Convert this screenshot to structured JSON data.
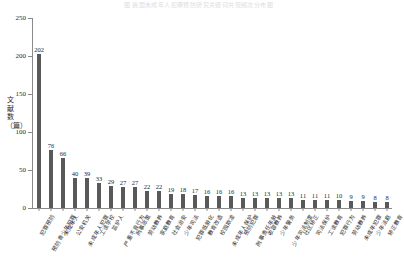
{
  "top_caption": "图 我国未成年人犯罪预防研究关键词共现频次分布图",
  "chart_data": {
    "type": "bar",
    "title": "",
    "subtitle": "",
    "xlabel": "",
    "ylabel": "文献数（篇）",
    "ylabel_chars": [
      "文",
      "献",
      "数",
      "（",
      "篇",
      "）"
    ],
    "ylim": [
      0,
      250
    ],
    "yticks": [
      0,
      50,
      100,
      150,
      200,
      250
    ],
    "ytick_labels": [
      "0",
      "50",
      "100",
      "150",
      "200",
      "250"
    ],
    "grid": false,
    "legend": null,
    "bar_color": "#595959",
    "axis_color": "#8a8a8a",
    "categories": [
      "犯罪预防",
      "预防青少年犯罪",
      "未成年人",
      "公安机关",
      "未成年人犯罪",
      "工读学校",
      "监护人",
      "严重不良行为",
      "刑事政策",
      "劳动教养",
      "家庭教育",
      "社会治安",
      "少年司法",
      "犯罪低龄化",
      "教育改造",
      "校园欺凌",
      "未成年人保护",
      "预防犯罪",
      "刑事责任年龄",
      "收容教养",
      "少年警务",
      "少年司法制度",
      "社区矫正",
      "司法保护",
      "工读教育",
      "犯罪行为",
      "劳动教养",
      "未成年犯罪",
      "少年法庭",
      "矫正教育"
    ],
    "values": [
      202,
      76,
      66,
      40,
      39,
      33,
      29,
      27,
      27,
      22,
      22,
      19,
      18,
      17,
      16,
      16,
      16,
      13,
      13,
      13,
      13,
      13,
      11,
      11,
      11,
      10,
      9,
      9,
      8,
      8
    ],
    "value_labels": [
      "202",
      "76",
      "66",
      "40",
      "39",
      "33",
      "29",
      "27",
      "27",
      "22",
      "22",
      "19",
      "18",
      "17",
      "16",
      "16",
      "16",
      "13",
      "13",
      "13",
      "13",
      "13",
      "11",
      "11",
      "11",
      "10",
      "9",
      "9",
      "8",
      "8"
    ]
  }
}
